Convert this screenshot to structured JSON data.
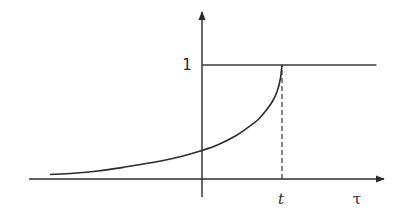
{
  "chart_data": {
    "type": "line",
    "title": "",
    "xlabel": "τ",
    "ylabel": "",
    "x_tick_labels": [
      {
        "value": 1,
        "label": "t"
      }
    ],
    "y_tick_labels": [
      {
        "value": 1,
        "label": "1"
      }
    ],
    "xlim": [
      -2.15,
      2.3
    ],
    "ylim": [
      0,
      1.17
    ],
    "grid": false,
    "series": [
      {
        "name": "curve",
        "x": [
          -1.9,
          -1.6,
          -1.3,
          -1.0,
          -0.75,
          -0.5,
          -0.25,
          0.0,
          0.2,
          0.4,
          0.55,
          0.7,
          0.8,
          0.88,
          0.94,
          0.98,
          1.0
        ],
        "y": [
          0.04,
          0.05,
          0.07,
          0.1,
          0.13,
          0.16,
          0.2,
          0.25,
          0.3,
          0.37,
          0.44,
          0.52,
          0.6,
          0.68,
          0.77,
          0.88,
          1.0
        ]
      }
    ],
    "reference_lines": [
      {
        "type": "horizontal",
        "y": 1,
        "x_from": 0,
        "x_to": 2.18,
        "style": "solid"
      },
      {
        "type": "vertical",
        "x": 1,
        "y_from": 0,
        "y_to": 1,
        "style": "dashed"
      }
    ]
  }
}
